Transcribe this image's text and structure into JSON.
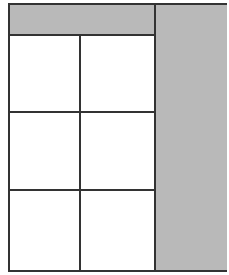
{
  "diagram": {
    "type": "layout-wireframe",
    "colors": {
      "border": "#333333",
      "fill_gray": "#b9b9b9",
      "fill_white": "#ffffff"
    },
    "header_bar": {
      "fill": "gray",
      "label": ""
    },
    "side_column": {
      "fill": "gray",
      "label": ""
    },
    "grid": {
      "rows": 3,
      "columns": 2,
      "cells": [
        {
          "row": 0,
          "col": 0,
          "label": ""
        },
        {
          "row": 0,
          "col": 1,
          "label": ""
        },
        {
          "row": 1,
          "col": 0,
          "label": ""
        },
        {
          "row": 1,
          "col": 1,
          "label": ""
        },
        {
          "row": 2,
          "col": 0,
          "label": ""
        },
        {
          "row": 2,
          "col": 1,
          "label": ""
        }
      ]
    }
  }
}
